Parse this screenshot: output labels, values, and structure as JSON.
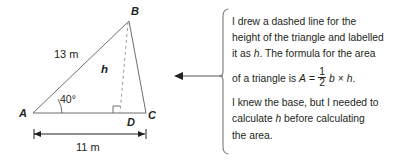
{
  "figure": {
    "type": "geometry-diagram-with-callout",
    "diagram": {
      "shape": "triangle",
      "vertices": {
        "B": "B",
        "A": "A",
        "C": "C",
        "D": "D"
      },
      "side_labels": {
        "slant": "13 m",
        "base": "11 m"
      },
      "angle_label": "40°",
      "height_label": "h",
      "height_line_style": "dashed",
      "right_angle_marker": "right-angle-square",
      "stroke_color": "#231f20",
      "dimension_line_label": "11 m"
    },
    "arrow": {
      "direction": "left",
      "name": "pointer-arrow"
    },
    "callout": {
      "bracket": "left-curly-bracket",
      "lines": [
        "I drew a dashed line for the",
        "height of the triangle and labelled",
        "it as h. The formula for the area"
      ],
      "formula": {
        "prefix": "of a triangle is",
        "variable_A": "A",
        "equals": "=",
        "numerator": "1",
        "denominator": "2",
        "variable_b": "b",
        "times": "×",
        "variable_h": "h",
        "period": "."
      },
      "lines_after": [
        "I knew the base, but I needed to",
        "calculate h before calculating",
        "the area."
      ]
    }
  }
}
